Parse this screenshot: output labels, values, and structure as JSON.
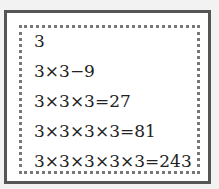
{
  "lines": [
    "3",
    "3×3−9",
    "3×3×3=27",
    "3×3×3×3=81",
    "3×3×3×3×3=243"
  ]
}
